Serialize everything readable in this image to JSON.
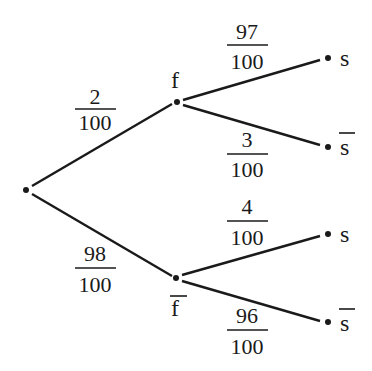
{
  "diagram": {
    "type": "probability-tree",
    "nodes": {
      "root": {
        "label": ""
      },
      "f": {
        "label": "f"
      },
      "f_bar": {
        "label": "f",
        "overline": true
      },
      "s_top": {
        "label": "s"
      },
      "s_bar_top": {
        "label": "s",
        "overline": true
      },
      "s_bottom": {
        "label": "s"
      },
      "s_bar_bottom": {
        "label": "s",
        "overline": true
      }
    },
    "edges": [
      {
        "from": "root",
        "to": "f",
        "numerator": "2",
        "denominator": "100"
      },
      {
        "from": "root",
        "to": "f_bar",
        "numerator": "98",
        "denominator": "100"
      },
      {
        "from": "f",
        "to": "s_top",
        "numerator": "97",
        "denominator": "100"
      },
      {
        "from": "f",
        "to": "s_bar_top",
        "numerator": "3",
        "denominator": "100"
      },
      {
        "from": "f_bar",
        "to": "s_bottom",
        "numerator": "4",
        "denominator": "100"
      },
      {
        "from": "f_bar",
        "to": "s_bar_bottom",
        "numerator": "96",
        "denominator": "100"
      }
    ]
  }
}
